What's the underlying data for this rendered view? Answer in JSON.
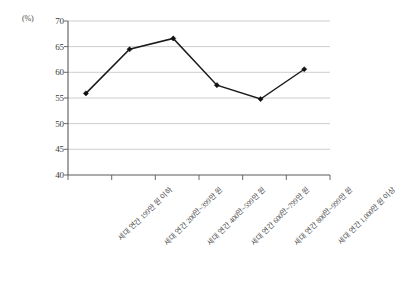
{
  "chart_data": {
    "type": "line",
    "title": "",
    "subtitle": "",
    "xlabel": "",
    "ylabel": "(%)",
    "unit_label": "(%)",
    "ylim": [
      40,
      70
    ],
    "ytick_values": [
      70,
      65,
      60,
      55,
      50,
      45,
      40
    ],
    "ytick_labels": [
      "70",
      "65",
      "60",
      "55",
      "50",
      "45",
      "40"
    ],
    "grid": true,
    "legend": "none",
    "categories": [
      "세대 연간 199만 원 이하",
      "세대 연간 200만~399만 원",
      "세대 연간 400만~599만 원",
      "세대 연간 600만~799만 원",
      "세대 연간 800만~999만 원",
      "세대 연간 1,000만 원 이상"
    ],
    "series": [
      {
        "name": "",
        "values": [
          55.9,
          64.5,
          66.6,
          57.5,
          54.8,
          60.6
        ]
      }
    ],
    "marker": "diamond",
    "line_color": "#111111"
  }
}
